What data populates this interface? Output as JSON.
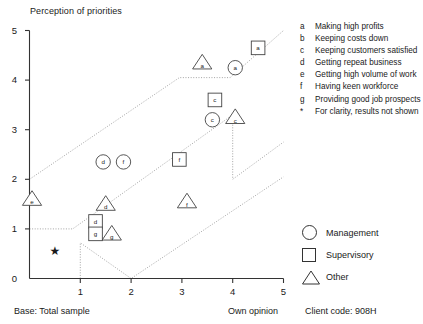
{
  "chart_data": {
    "type": "scatter",
    "title": "Perception of priorities",
    "xlabel": "Own opinion",
    "ylabel": "Perception of priorities",
    "xlim": [
      0,
      5
    ],
    "ylim": [
      0,
      5
    ],
    "xticks": [
      "1",
      "2",
      "3",
      "4",
      "5"
    ],
    "yticks": [
      "0",
      "1",
      "2",
      "3",
      "4",
      "5"
    ],
    "grid": false,
    "base_note": "Base: Total sample",
    "client_code": "Client code:  908H",
    "star_marker": {
      "x": 0.5,
      "y": 0.55,
      "glyph": "★"
    },
    "series": [
      {
        "name": "Management",
        "marker": "circle",
        "points": [
          {
            "label": "a",
            "x": 4.05,
            "y": 4.25
          },
          {
            "label": "c",
            "x": 3.6,
            "y": 3.2
          },
          {
            "label": "d",
            "x": 1.45,
            "y": 2.35
          },
          {
            "label": "f",
            "x": 1.85,
            "y": 2.35
          }
        ]
      },
      {
        "name": "Supervisory",
        "marker": "square",
        "points": [
          {
            "label": "a",
            "x": 4.5,
            "y": 4.65
          },
          {
            "label": "c",
            "x": 3.65,
            "y": 3.6
          },
          {
            "label": "f",
            "x": 2.95,
            "y": 2.4
          },
          {
            "label": "d",
            "x": 1.3,
            "y": 1.15
          },
          {
            "label": "g",
            "x": 1.3,
            "y": 0.9
          }
        ]
      },
      {
        "name": "Other",
        "marker": "triangle",
        "points": [
          {
            "label": "a",
            "x": 3.4,
            "y": 4.35
          },
          {
            "label": "c",
            "x": 4.05,
            "y": 3.25
          },
          {
            "label": "e",
            "x": 0.05,
            "y": 1.6
          },
          {
            "label": "d",
            "x": 1.5,
            "y": 1.5
          },
          {
            "label": "f",
            "x": 3.1,
            "y": 1.55
          },
          {
            "label": "g",
            "x": 1.62,
            "y": 0.9
          }
        ]
      }
    ],
    "bands": [
      {
        "name": "upper-band",
        "points": [
          [
            0,
            2.0
          ],
          [
            2.95,
            4.05
          ],
          [
            3.95,
            4.05
          ],
          [
            5,
            5.0
          ]
        ]
      },
      {
        "name": "middle-band",
        "points": [
          [
            0,
            1.0
          ],
          [
            0.85,
            1.0
          ],
          [
            4.0,
            3.3
          ],
          [
            4.0,
            2.0
          ],
          [
            5,
            2.75
          ]
        ]
      },
      {
        "name": "lower-band",
        "points": [
          [
            1.0,
            0
          ],
          [
            1.0,
            0.72
          ],
          [
            2.0,
            0
          ],
          [
            5,
            2.05
          ]
        ]
      }
    ]
  },
  "legend_codes": [
    {
      "key": "a",
      "text": "Making high profits"
    },
    {
      "key": "b",
      "text": "Keeping costs down"
    },
    {
      "key": "c",
      "text": "Keeping customers satisfied"
    },
    {
      "key": "d",
      "text": "Getting repeat business"
    },
    {
      "key": "e",
      "text": "Getting high volume of work"
    },
    {
      "key": "f",
      "text": "Having keen workforce"
    },
    {
      "key": "g",
      "text": "Providing good job prospects"
    },
    {
      "key": "*",
      "text": "For clarity, results not shown"
    }
  ],
  "legend_shapes": [
    {
      "shape": "circle",
      "label": "Management"
    },
    {
      "shape": "square",
      "label": "Supervisory"
    },
    {
      "shape": "triangle",
      "label": "Other"
    }
  ],
  "colors": {
    "axis": "#333333",
    "marker": "#444444",
    "band": "#9a9a9a",
    "text": "#1a1a1a"
  }
}
